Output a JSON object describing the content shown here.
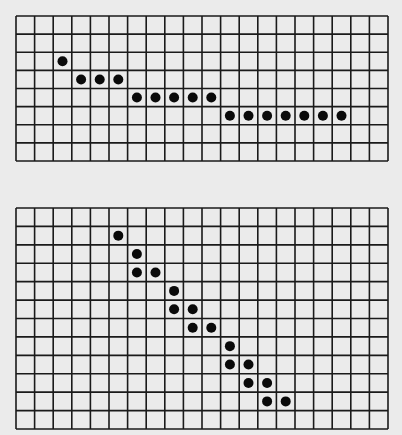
{
  "grids": [
    {
      "name": "top-grid",
      "columns": 20,
      "rows": 8,
      "dots": [
        [
          2,
          2
        ],
        [
          3,
          3
        ],
        [
          4,
          3
        ],
        [
          5,
          3
        ],
        [
          6,
          4
        ],
        [
          7,
          4
        ],
        [
          8,
          4
        ],
        [
          9,
          4
        ],
        [
          10,
          4
        ],
        [
          11,
          5
        ],
        [
          12,
          5
        ],
        [
          13,
          5
        ],
        [
          14,
          5
        ],
        [
          15,
          5
        ],
        [
          16,
          5
        ],
        [
          17,
          5
        ]
      ]
    },
    {
      "name": "bottom-grid",
      "columns": 20,
      "rows": 12,
      "dots": [
        [
          5,
          1
        ],
        [
          6,
          2
        ],
        [
          6,
          3
        ],
        [
          7,
          3
        ],
        [
          8,
          4
        ],
        [
          8,
          5
        ],
        [
          9,
          5
        ],
        [
          9,
          6
        ],
        [
          10,
          6
        ],
        [
          11,
          7
        ],
        [
          11,
          8
        ],
        [
          12,
          8
        ],
        [
          12,
          9
        ],
        [
          13,
          9
        ],
        [
          13,
          10
        ],
        [
          14,
          10
        ]
      ]
    }
  ],
  "colors": {
    "line": "#1a1a1a",
    "dot": "#0a0a0a",
    "paper": "#ebebeb"
  }
}
